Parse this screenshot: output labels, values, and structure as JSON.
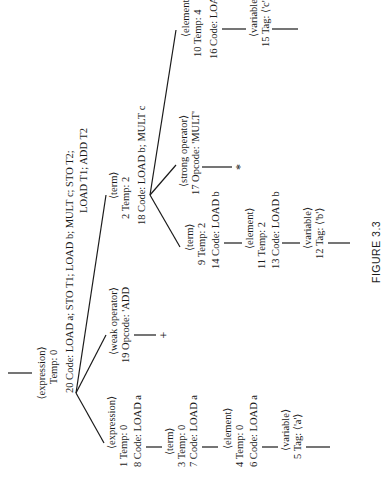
{
  "figure_caption": "FIGURE 3.3",
  "nodes": {
    "root": {
      "label": "⟨expression⟩",
      "temp": "Temp:  0",
      "code_line1": "20 Code:   LOAD a; STO T1; LOAD b; MULT c; STO T2;",
      "code_line2": "LOAD T1; ADD T2"
    },
    "left_expression": {
      "label": "⟨expression⟩",
      "temp": "1 Temp:  0",
      "code": "8 Code:    LOAD a"
    },
    "left_term": {
      "label": "⟨term⟩",
      "temp": "3 Temp:  0",
      "code": "7 Code:    LOAD a"
    },
    "left_element": {
      "label": "⟨element⟩",
      "temp": "4 Temp:  0",
      "code": "6 Code:    LOAD a"
    },
    "left_variable": {
      "label": "⟨variable⟩",
      "tag": "5 Tag:  ⟨'a'⟩"
    },
    "weak_operator": {
      "label": "⟨weak operator⟩",
      "opcode": "19 Opcode:  'ADD",
      "symbol": "+"
    },
    "right_term": {
      "label": "⟨term⟩",
      "temp": "2 Temp:  2",
      "code": "18 Code:    LOAD b; MULT c"
    },
    "inner_term": {
      "label": "⟨term⟩",
      "temp": "9 Temp:  2",
      "code": "14 Code:    LOAD b"
    },
    "inner_element": {
      "label": "⟨element⟩",
      "temp": "11 Temp:  2",
      "code": "13 Code:    LOAD b"
    },
    "inner_variable": {
      "label": "⟨variable⟩",
      "tag": "12 Tag:  ⟨'b'⟩"
    },
    "strong_operator": {
      "label": "⟨strong operator⟩",
      "opcode": "17 Opcode:  'MULT'",
      "symbol": "*"
    },
    "right_element": {
      "label": "⟨element⟩",
      "temp": "10 Temp:  4",
      "code": "16 Code:    LOAD c"
    },
    "right_variable": {
      "label": "⟨variable⟩",
      "tag": "15 Tag:  ⟨'c'⟩"
    }
  }
}
